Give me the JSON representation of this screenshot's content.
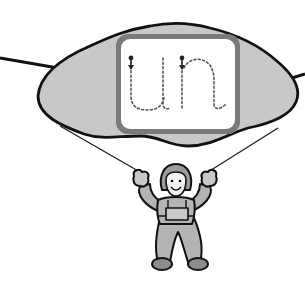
{
  "scene": {
    "description": "Parachute canopy carrying a letter-tracing board, with a cartoon child hanging below",
    "tracing_board": {
      "letters": "un",
      "style": "dotted-trace",
      "stroke_start_markers": 2
    },
    "colors": {
      "background": "#ffffff",
      "canopy_fill": "#c8c8c8",
      "outline": "#111111",
      "board_frame": "#7a7a7a",
      "board_face": "#ffffff",
      "dotted_trace": "#555555",
      "figure_fill": "#b4b4b4",
      "figure_dark": "#8c8c8c",
      "face_fill": "#f2f2f2"
    }
  }
}
